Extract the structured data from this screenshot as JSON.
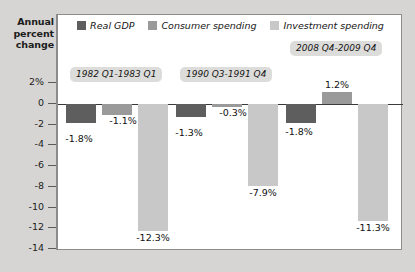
{
  "axis_caption": {
    "line1": "Annual",
    "line2": "percent",
    "line3": "change"
  },
  "legend": {
    "items": [
      {
        "label": "Real GDP",
        "color": "#5e5e5e",
        "icon": "legend-swatch-icon"
      },
      {
        "label": "Consumer spending",
        "color": "#9a9a9a",
        "icon": "legend-swatch-icon"
      },
      {
        "label": "Investment spending",
        "color": "#c8c8c8",
        "icon": "legend-swatch-icon"
      }
    ]
  },
  "chart_data": {
    "type": "bar",
    "title": "",
    "subtitle": "",
    "xlabel": "",
    "ylabel": "Annual percent change",
    "ylim": [
      -14,
      2
    ],
    "yticks": [
      "2%",
      "0",
      "-2",
      "-4",
      "-6",
      "-8",
      "-10",
      "-12",
      "-14"
    ],
    "ytick_values": [
      2,
      0,
      -2,
      -4,
      -6,
      -8,
      -10,
      -12,
      -14
    ],
    "grid": false,
    "legend_position": "top-center",
    "categories": [
      "1982 Q1-1983 Q1",
      "1990 Q3-1991 Q4",
      "2008 Q4-2009 Q4"
    ],
    "series": [
      {
        "name": "Real GDP",
        "color": "#5e5e5e",
        "values": [
          -1.8,
          -1.3,
          -1.8
        ],
        "labels": [
          "-1.8%",
          "-1.3%",
          "-1.8%"
        ]
      },
      {
        "name": "Consumer spending",
        "color": "#9a9a9a",
        "values": [
          -1.1,
          -0.3,
          1.2
        ],
        "labels": [
          "-1.1%",
          "-0.3%",
          "1.2%"
        ]
      },
      {
        "name": "Investment spending",
        "color": "#c8c8c8",
        "values": [
          -12.3,
          -7.9,
          -11.3
        ],
        "labels": [
          "-12.3%",
          "-7.9%",
          "-11.3%"
        ]
      }
    ]
  },
  "groups": [
    {
      "pill_label": "1982 Q1-1983 Q1"
    },
    {
      "pill_label": "1990 Q3-1991 Q4"
    },
    {
      "pill_label": "2008 Q4-2009 Q4"
    }
  ],
  "colors": {
    "background": "#d6d5d3",
    "plot_background": "#ffffff",
    "frame": "#8c8c8c",
    "zero_line": "#3a3a3a",
    "pill_background": "#dcdcda",
    "text": "#1c1c1c"
  }
}
